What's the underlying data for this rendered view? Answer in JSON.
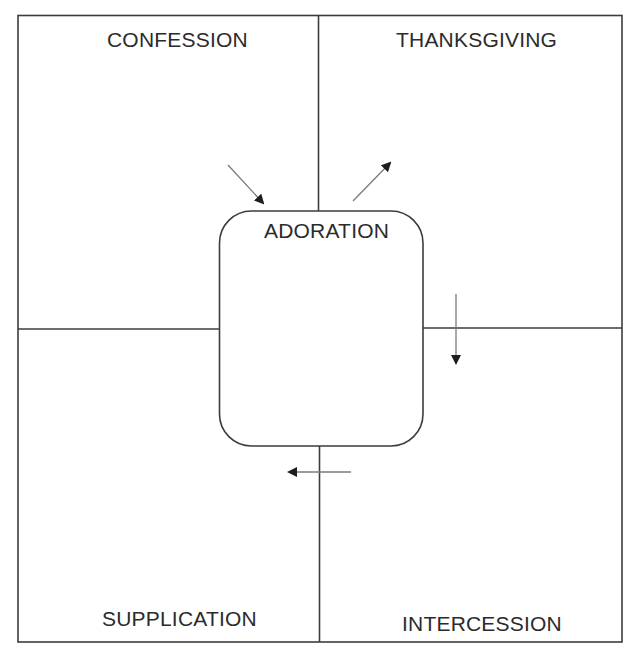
{
  "diagram": {
    "quadrants": {
      "top_left": {
        "label": "CONFESSION"
      },
      "top_right": {
        "label": "THANKSGIVING"
      },
      "bottom_left": {
        "label": "SUPPLICATION"
      },
      "bottom_right": {
        "label": "INTERCESSION"
      }
    },
    "center": {
      "label": "ADORATION"
    },
    "arrows": [
      {
        "id": "arrow-into-adoration",
        "direction": "down-right",
        "from": "CONFESSION",
        "to": "ADORATION"
      },
      {
        "id": "arrow-to-thanksgiving",
        "direction": "up-right",
        "from": "ADORATION",
        "to": "THANKSGIVING"
      },
      {
        "id": "arrow-to-intercession",
        "direction": "down",
        "from": "THANKSGIVING",
        "to": "INTERCESSION"
      },
      {
        "id": "arrow-to-supplication",
        "direction": "left",
        "from": "INTERCESSION",
        "to": "SUPPLICATION"
      }
    ],
    "colors": {
      "line": "#3c3c3c",
      "arrow": "#7a7a7a",
      "arrowhead": "#1e1e1e",
      "text": "#2b2b2b",
      "background": "#ffffff"
    }
  }
}
